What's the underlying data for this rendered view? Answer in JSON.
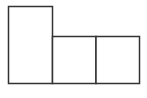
{
  "diagram": {
    "type": "rectangle-arrangement",
    "stroke_color": "#333333",
    "fill_color": "#ffffff",
    "shapes": [
      {
        "id": "tall-rectangle",
        "kind": "rectangle"
      },
      {
        "id": "middle-square",
        "kind": "square"
      },
      {
        "id": "right-square",
        "kind": "square"
      }
    ]
  }
}
